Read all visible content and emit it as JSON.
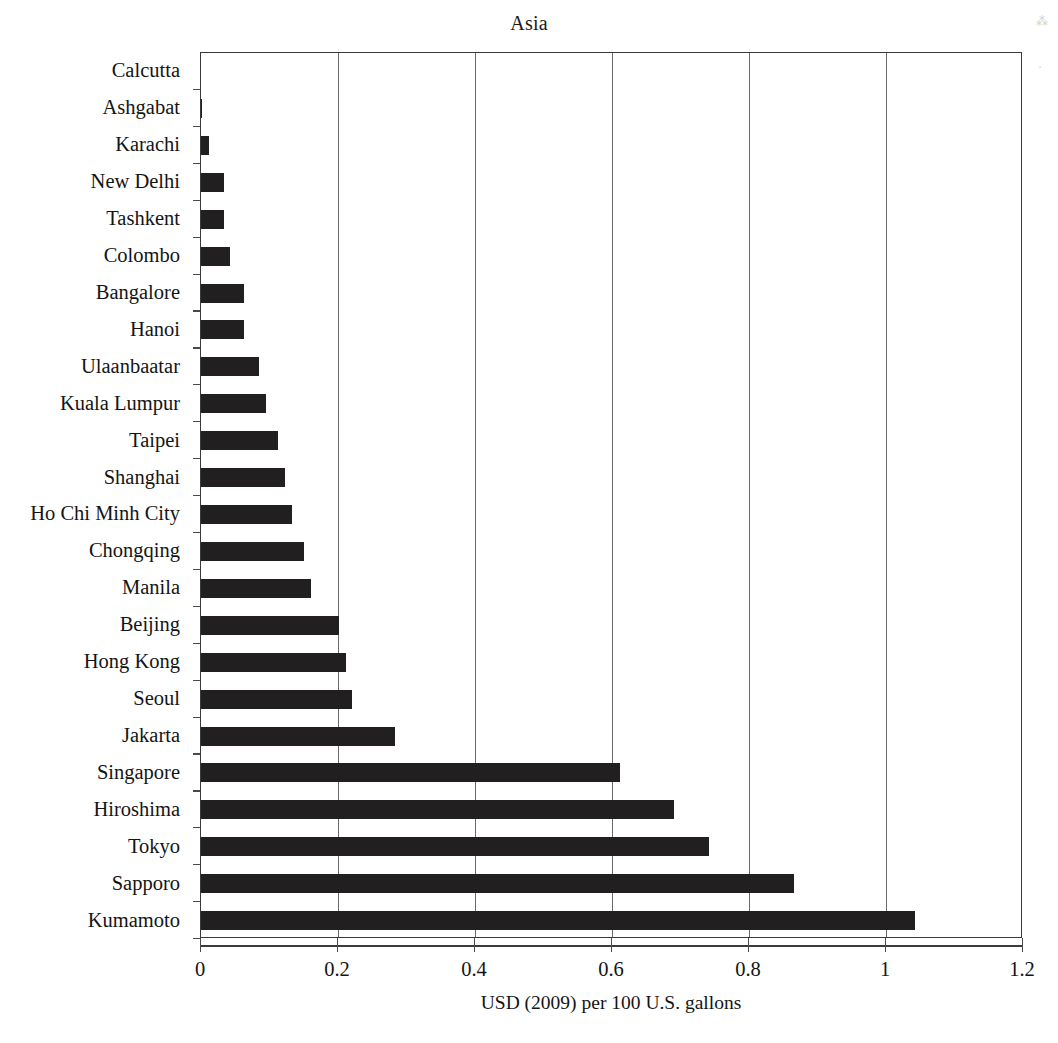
{
  "chart_data": {
    "type": "bar",
    "orientation": "horizontal",
    "title": "Asia",
    "xlabel": "USD (2009) per 100 U.S. gallons",
    "ylabel": "",
    "xlim": [
      0,
      1.2
    ],
    "xticks": [
      "0",
      "0.2",
      "0.4",
      "0.6",
      "0.8",
      "1",
      "1.2"
    ],
    "xtick_values": [
      0,
      0.2,
      0.4,
      0.6,
      0.8,
      1.0,
      1.2
    ],
    "grid": "vertical",
    "legend": "none",
    "bar_color": "#221f20",
    "categories": [
      "Calcutta",
      "Ashgabat",
      "Karachi",
      "New Delhi",
      "Tashkent",
      "Colombo",
      "Bangalore",
      "Hanoi",
      "Ulaanbaatar",
      "Kuala Lumpur",
      "Taipei",
      "Shanghai",
      "Ho Chi Minh City",
      "Chongqing",
      "Manila",
      "Beijing",
      "Hong Kong",
      "Seoul",
      "Jakarta",
      "Singapore",
      "Hiroshima",
      "Tokyo",
      "Sapporo",
      "Kumamoto"
    ],
    "values": [
      0.0,
      0.002,
      0.012,
      0.033,
      0.033,
      0.043,
      0.063,
      0.063,
      0.085,
      0.095,
      0.112,
      0.122,
      0.133,
      0.15,
      0.16,
      0.201,
      0.212,
      0.221,
      0.283,
      0.612,
      0.69,
      0.742,
      0.865,
      1.043
    ]
  }
}
